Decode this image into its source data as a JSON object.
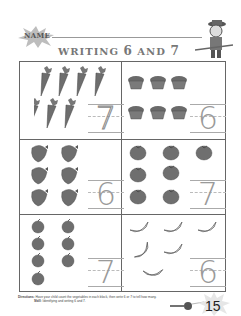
{
  "header": {
    "name_label": "NAME",
    "title_prefix": "WRITING",
    "title_num1": "6",
    "title_and": "AND",
    "title_num2": "7"
  },
  "boxes": [
    {
      "id": "carrots",
      "item": "carrot-icon",
      "count": 7,
      "answer": "7",
      "style": "dotted-trace"
    },
    {
      "id": "muffins",
      "item": "muffin-icon",
      "count": 6,
      "answer": "6",
      "style": "trace"
    },
    {
      "id": "strawberries",
      "item": "strawberry-icon",
      "count": 6,
      "answer": "6",
      "style": "trace"
    },
    {
      "id": "tomatoes",
      "item": "tomato-icon",
      "count": 7,
      "answer": "7",
      "style": "trace"
    },
    {
      "id": "apples",
      "item": "apple-icon",
      "count": 7,
      "answer": "7",
      "style": "trace"
    },
    {
      "id": "bananas",
      "item": "banana-icon",
      "count": 6,
      "answer": "6",
      "style": "trace"
    }
  ],
  "footer": {
    "directions_label": "Directions:",
    "directions_text": "Have your child count the vegetables in each block, then write 6 or 7 to tell how many.",
    "skill_label": "Skill:",
    "skill_text": "Identifying and writing 6 and 7.",
    "page_number": "15"
  },
  "colors": {
    "border": "#666666",
    "item_fill": "#7a7a7a",
    "trace_digit": "#9a9a9a"
  }
}
